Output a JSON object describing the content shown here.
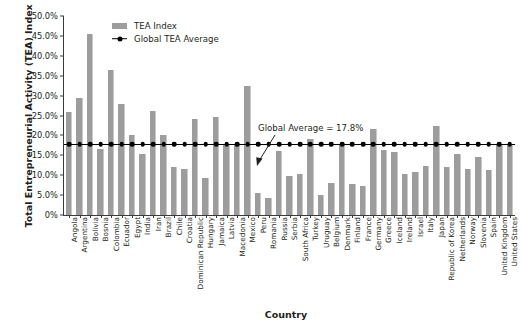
{
  "chart_data": {
    "type": "bar",
    "title": "",
    "xlabel": "Country",
    "ylabel": "Total Entrepreneurial Activity (TEA) Index",
    "ylim": [
      0,
      50
    ],
    "ytick_labels": [
      "0%",
      "5.0%",
      "10.0%",
      "15.0%",
      "20.0%",
      "25.0%",
      "30.0%",
      "35.0%",
      "40.0%",
      "45.0%",
      "50.0%"
    ],
    "ytick_values": [
      0,
      5,
      10,
      15,
      20,
      25,
      30,
      35,
      40,
      45,
      50
    ],
    "grid": false,
    "legend_position": "top-left-inside",
    "legend": [
      "TEA Index",
      "Global TEA Average"
    ],
    "annotation": "Global Average = 17.8%",
    "global_average": 17.8,
    "units": "percent",
    "categories": [
      "Angola",
      "Argentina",
      "Bolivia",
      "Bosnia",
      "Colombia",
      "Ecuador",
      "Egypt",
      "India",
      "Iran",
      "Brazil",
      "Chile",
      "Croatia",
      "Dominican Republic",
      "Hungary",
      "Jamaica",
      "Latvia",
      "Macedonia",
      "Mexico",
      "Peru",
      "Romania",
      "Russia",
      "Serbia",
      "South Africa",
      "Turkey",
      "Uruguay",
      "Belgium",
      "Denmark",
      "Finland",
      "France",
      "Germany",
      "Greece",
      "Iceland",
      "Ireland",
      "Israel",
      "Italy",
      "Japan",
      "Republic of Korea",
      "Netherlands",
      "Norway",
      "Slovenia",
      "Spain",
      "United Kingdom",
      "United States"
    ],
    "values": [
      25.8,
      29.4,
      45.4,
      16.6,
      36.4,
      27.9,
      20.0,
      15.4,
      26.2,
      20.0,
      12.0,
      11.5,
      24.1,
      9.3,
      24.6,
      17.6,
      17.6,
      32.4,
      5.6,
      4.3,
      16.0,
      9.7,
      10.4,
      19.0,
      5.1,
      8.0,
      17.7,
      7.9,
      7.3,
      21.7,
      16.3,
      15.9,
      10.3,
      10.7,
      12.4,
      22.3,
      12.0,
      15.4,
      11.5,
      14.5,
      11.4,
      17.6,
      17.7
    ],
    "series": [
      {
        "name": "TEA Index",
        "color": "#9d9d9d",
        "values": [
          25.8,
          29.4,
          45.4,
          16.6,
          36.4,
          27.9,
          20.0,
          15.4,
          26.2,
          20.0,
          12.0,
          11.5,
          24.1,
          9.3,
          24.6,
          17.6,
          17.6,
          32.4,
          5.6,
          4.3,
          16.0,
          9.7,
          10.4,
          19.0,
          5.1,
          8.0,
          17.7,
          7.9,
          7.3,
          21.7,
          16.3,
          15.9,
          10.3,
          10.7,
          12.4,
          22.3,
          12.0,
          15.4,
          11.5,
          14.5,
          11.4,
          17.6,
          17.7
        ]
      },
      {
        "name": "Global TEA Average",
        "color": "#000000",
        "constant": 17.8
      }
    ]
  },
  "axes": {
    "y_title": "Total Entrepreneurial Activity (TEA) Index",
    "x_title": "Country"
  },
  "legend": {
    "bar_label": "TEA Index",
    "line_label": "Global TEA Average"
  },
  "annotation": {
    "text": "Global Average = 17.8%"
  }
}
